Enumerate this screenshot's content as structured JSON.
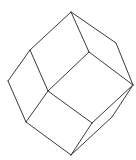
{
  "diagram": {
    "title": "",
    "shape": "rhombic-dodecahedron-wireframe",
    "stroke_color": "#3a3a3a",
    "background": "#ffffff",
    "vertices": {
      "top": [
        71,
        12
      ],
      "upper_left": [
        30,
        50
      ],
      "upper_right": [
        116,
        43
      ],
      "inner_top": [
        89,
        52
      ],
      "left": [
        8,
        81
      ],
      "center": [
        48,
        91
      ],
      "right": [
        133,
        85
      ],
      "lower_left": [
        26,
        122
      ],
      "inner_bottom": [
        92,
        123
      ],
      "lower_right": [
        112,
        117
      ],
      "bottom": [
        71,
        155
      ]
    },
    "edges": [
      [
        "top",
        "upper_left"
      ],
      [
        "top",
        "upper_right"
      ],
      [
        "top",
        "inner_top"
      ],
      [
        "upper_right",
        "right"
      ],
      [
        "inner_top",
        "right"
      ],
      [
        "inner_top",
        "center"
      ],
      [
        "upper_left",
        "left"
      ],
      [
        "upper_left",
        "center"
      ],
      [
        "left",
        "lower_left"
      ],
      [
        "center",
        "lower_left"
      ],
      [
        "center",
        "inner_bottom"
      ],
      [
        "lower_left",
        "bottom"
      ],
      [
        "inner_bottom",
        "right"
      ],
      [
        "inner_bottom",
        "bottom"
      ],
      [
        "right",
        "lower_right"
      ],
      [
        "lower_right",
        "bottom"
      ]
    ]
  }
}
